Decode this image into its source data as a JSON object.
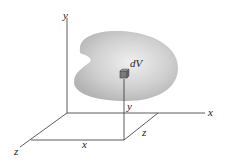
{
  "diagram": {
    "type": "3d-coordinate-volume-element",
    "labels": {
      "y_axis": "y",
      "x_axis": "x",
      "z_axis": "z",
      "element": "dV",
      "y_dim": "y",
      "z_dim": "z",
      "x_dim": "x"
    },
    "colors": {
      "body": "#c8c8c8",
      "body_highlight": "#ececec",
      "cube": "#7a7a7a",
      "lines": "#333333"
    }
  }
}
